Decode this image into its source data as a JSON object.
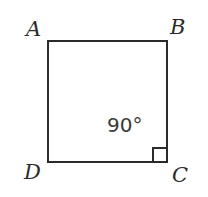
{
  "figure": {
    "name": "square-abcd-right-angle-diagram",
    "shape": "square",
    "background_color": "#ffffff",
    "stroke_color": "#2b2b2b",
    "stroke_width": 2,
    "square": {
      "left": 48,
      "top": 41,
      "right": 167,
      "bottom": 162,
      "width": 119,
      "height": 121
    },
    "vertices": [
      {
        "id": "a",
        "label": "A",
        "position": "top-left"
      },
      {
        "id": "b",
        "label": "B",
        "position": "top-right"
      },
      {
        "id": "c",
        "label": "C",
        "position": "bottom-right"
      },
      {
        "id": "d",
        "label": "D",
        "position": "bottom-left"
      }
    ],
    "angle_marker": {
      "label": "90°",
      "at_vertex": "C",
      "marker_type": "right-angle-square",
      "marker_size": 13
    }
  }
}
